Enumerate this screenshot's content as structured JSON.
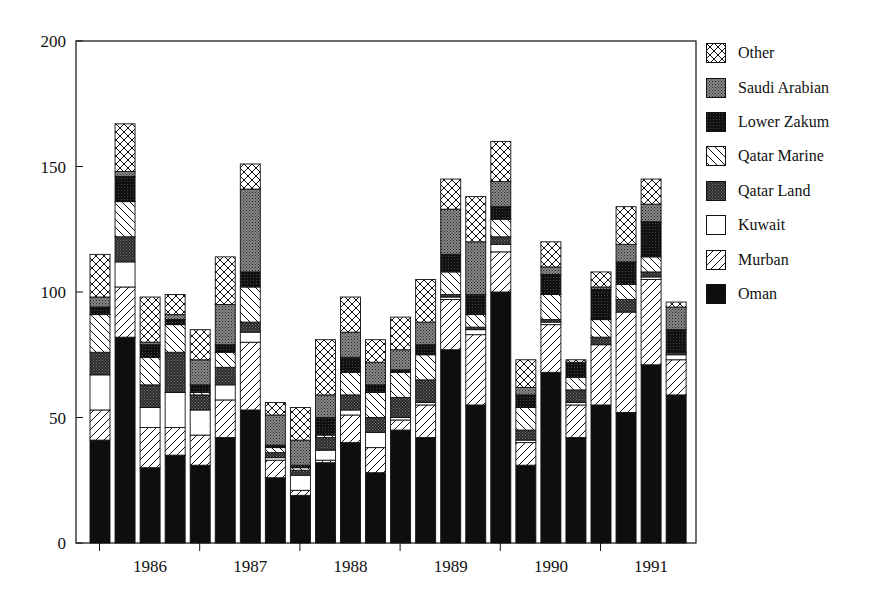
{
  "chart_data": {
    "type": "bar",
    "stacked": true,
    "title": "",
    "xlabel": "",
    "ylabel": "",
    "ylim": [
      0,
      200
    ],
    "yticks": [
      0,
      50,
      100,
      150,
      200
    ],
    "grid": false,
    "legend_position": "right",
    "x_groups": [
      "1986",
      "1987",
      "1988",
      "1989",
      "1990",
      "1991"
    ],
    "bars_per_group": 4,
    "categories": [
      "1986 Q1",
      "1986 Q2",
      "1986 Q3",
      "1986 Q4",
      "1987 Q1",
      "1987 Q2",
      "1987 Q3",
      "1987 Q4",
      "1988 Q1",
      "1988 Q2",
      "1988 Q3",
      "1988 Q4",
      "1989 Q1",
      "1989 Q2",
      "1989 Q3",
      "1989 Q4",
      "1990 Q1",
      "1990 Q2",
      "1990 Q3",
      "1990 Q4",
      "1991 Q1",
      "1991 Q2",
      "1991 Q3",
      "1991 Q4"
    ],
    "series": [
      {
        "name": "Oman",
        "pattern": "solid-black",
        "values": [
          41,
          82,
          30,
          35,
          31,
          42,
          53,
          26,
          19,
          32,
          40,
          28,
          45,
          42,
          77,
          55,
          100,
          31,
          68,
          42,
          55,
          52,
          71,
          59
        ]
      },
      {
        "name": "Murban",
        "pattern": "diagonal-up",
        "values": [
          12,
          20,
          16,
          11,
          12,
          15,
          27,
          7,
          2,
          1,
          11,
          10,
          4,
          13,
          20,
          28,
          16,
          9,
          19,
          13,
          24,
          40,
          34,
          14
        ]
      },
      {
        "name": "Kuwait",
        "pattern": "white",
        "values": [
          14,
          10,
          8,
          14,
          10,
          6,
          4,
          1,
          6,
          4,
          2,
          6,
          1,
          1,
          1,
          2,
          3,
          1,
          1,
          1,
          0,
          0,
          1,
          2
        ]
      },
      {
        "name": "Qatar Land",
        "pattern": "dark-stipple",
        "values": [
          9,
          10,
          9,
          16,
          6,
          7,
          4,
          2,
          2,
          5,
          6,
          6,
          8,
          9,
          1,
          1,
          3,
          4,
          1,
          5,
          3,
          5,
          2,
          1
        ]
      },
      {
        "name": "Qatar Marine",
        "pattern": "diagonal-down",
        "values": [
          15,
          14,
          11,
          11,
          1,
          6,
          14,
          2,
          1,
          1,
          9,
          10,
          10,
          10,
          9,
          5,
          7,
          9,
          10,
          5,
          7,
          6,
          6,
          0
        ]
      },
      {
        "name": "Lower Zakum",
        "pattern": "near-black-stipple",
        "values": [
          3,
          10,
          5,
          2,
          3,
          3,
          6,
          1,
          1,
          7,
          6,
          3,
          1,
          4,
          7,
          8,
          5,
          5,
          8,
          6,
          12,
          9,
          14,
          9
        ]
      },
      {
        "name": "Saudi Arabian",
        "pattern": "grey-stipple",
        "values": [
          4,
          2,
          1,
          2,
          10,
          16,
          33,
          12,
          10,
          9,
          10,
          9,
          8,
          9,
          18,
          21,
          10,
          3,
          3,
          0,
          1,
          7,
          7,
          9
        ]
      },
      {
        "name": "Other",
        "pattern": "crosshatch",
        "values": [
          17,
          19,
          18,
          8,
          12,
          19,
          10,
          5,
          13,
          22,
          14,
          9,
          13,
          17,
          12,
          18,
          16,
          11,
          10,
          1,
          6,
          15,
          10,
          2
        ]
      }
    ]
  },
  "legend": {
    "items": [
      {
        "label": "Other",
        "pattern": "crosshatch"
      },
      {
        "label": "Saudi Arabian",
        "pattern": "grey-stipple"
      },
      {
        "label": "Lower Zakum",
        "pattern": "near-black-stipple"
      },
      {
        "label": "Qatar Marine",
        "pattern": "diagonal-down"
      },
      {
        "label": "Qatar Land",
        "pattern": "dark-stipple"
      },
      {
        "label": "Kuwait",
        "pattern": "white"
      },
      {
        "label": "Murban",
        "pattern": "diagonal-up"
      },
      {
        "label": "Oman",
        "pattern": "solid-black"
      }
    ]
  },
  "colors": {
    "ink": "#111111",
    "background": "#ffffff",
    "stipple_grey": "#6e6e6e",
    "stipple_dark": "#3a3a3a",
    "stipple_near_black": "#1c1c1c"
  }
}
